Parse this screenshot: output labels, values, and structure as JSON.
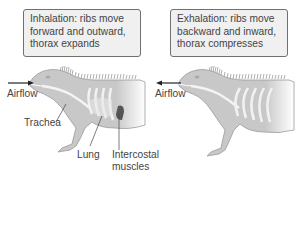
{
  "panels": [
    {
      "id": "inhalation",
      "caption_lines": [
        "Inhalation: ribs move",
        "forward and outward,",
        "thorax expands"
      ],
      "airflow_label": "Airflow",
      "airflow_direction": "into mouth"
    },
    {
      "id": "exhalation",
      "caption_lines": [
        "Exhalation: ribs move",
        "backward and inward,",
        "thorax compresses"
      ],
      "airflow_label": "Airflow",
      "airflow_direction": "out of mouth"
    }
  ],
  "anatomy_labels": {
    "trachea": "Trachea",
    "lung": "Lung",
    "intercostal_line1": "Intercostal",
    "intercostal_line2": "muscles"
  },
  "colors": {
    "body_fill": "#c8c8c8",
    "body_stroke": "#9a9a9a",
    "rib": "#f2f2f2",
    "muscle": "#555555",
    "box_fill": "#f0f0f0",
    "box_border": "#707070",
    "text": "#444444"
  }
}
